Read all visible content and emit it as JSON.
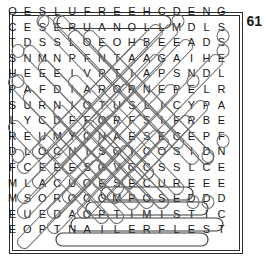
{
  "page": {
    "number": "61",
    "type": "word-search-puzzle",
    "grid_size": {
      "rows": 15,
      "cols": 15
    }
  },
  "grid": {
    "rows": [
      [
        "O",
        "E",
        "S",
        "L",
        "U",
        "F",
        "R",
        "E",
        "E",
        "H",
        "C",
        "D",
        "E",
        "N",
        "G"
      ],
      [
        "C",
        "E",
        "S",
        "E",
        "R",
        "U",
        "A",
        "N",
        "O",
        "L",
        "L",
        "M",
        "D",
        "L",
        "S"
      ],
      [
        "T",
        "D",
        "S",
        "S",
        "L",
        "O",
        "E",
        "O",
        "H",
        "B",
        "E",
        "E",
        "A",
        "D",
        "S"
      ],
      [
        "S",
        "N",
        "M",
        "N",
        "P",
        "F",
        "N",
        "T",
        "A",
        "A",
        "G",
        "A",
        "I",
        "H",
        "E"
      ],
      [
        "H",
        "E",
        "E",
        "E",
        "I",
        "V",
        "P",
        "T",
        "I",
        "A",
        "P",
        "S",
        "N",
        "D",
        "L"
      ],
      [
        "P",
        "A",
        "F",
        "D",
        "I",
        "A",
        "R",
        "O",
        "R",
        "N",
        "E",
        "P",
        "E",
        "L",
        "R"
      ],
      [
        "S",
        "U",
        "R",
        "N",
        "I",
        "O",
        "T",
        "U",
        "S",
        "L",
        "I",
        "C",
        "Y",
        "P",
        "A"
      ],
      [
        "L",
        "Y",
        "C",
        "D",
        "F",
        "F",
        "O",
        "R",
        "F",
        "S",
        "I",
        "F",
        "R",
        "B",
        "E"
      ],
      [
        "R",
        "E",
        "U",
        "M",
        "Y",
        "C",
        "N",
        "A",
        "E",
        "S",
        "E",
        "C",
        "E",
        "P",
        "F"
      ],
      [
        "D",
        "L",
        "O",
        "C",
        "N",
        "I",
        "S",
        "O",
        "I",
        "C",
        "O",
        "S",
        "I",
        "D",
        "N"
      ],
      [
        "F",
        "C",
        "E",
        "E",
        "E",
        "S",
        "G",
        "V",
        "C",
        "C",
        "S",
        "S",
        "L",
        "C",
        "E"
      ],
      [
        "M",
        "L",
        "A",
        "C",
        "U",
        "O",
        "E",
        "S",
        "E",
        "C",
        "U",
        "R",
        "E",
        "E",
        "E"
      ],
      [
        "M",
        "S",
        "O",
        "R",
        "O",
        "C",
        "O",
        "M",
        "P",
        "O",
        "S",
        "E",
        "D",
        "D",
        "D"
      ],
      [
        "E",
        "U",
        "E",
        "D",
        "A",
        "O",
        "P",
        "T",
        "I",
        "M",
        "I",
        "S",
        "T",
        "I",
        "C"
      ],
      [
        "E",
        "O",
        "P",
        "T",
        "N",
        "A",
        "I",
        "L",
        "E",
        "R",
        "F",
        "L",
        "E",
        "S",
        "T"
      ]
    ]
  },
  "found_words": [
    {
      "word": "CHEERFUL",
      "row": 1,
      "direction": "horizontal-reversed"
    },
    {
      "word": "SECURE",
      "row": 12,
      "direction": "horizontal"
    },
    {
      "word": "COMPOSED",
      "row": 13,
      "direction": "horizontal"
    },
    {
      "word": "OPTIMISTIC",
      "row": 14,
      "direction": "horizontal"
    },
    {
      "word": "SELFRELIANT",
      "row": 15,
      "direction": "horizontal-reversed"
    }
  ],
  "colors": {
    "ink": "#151515",
    "border": "#2b2b2b",
    "mark_light": "#6e6e6e",
    "mark_dark": "#3a3a3a",
    "background": "#ffffff"
  }
}
